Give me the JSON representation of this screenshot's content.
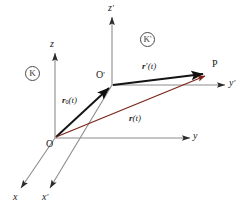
{
  "figure": {
    "background_color": "#ffffff",
    "width": 252,
    "height": 209
  },
  "colors": {
    "axis": "#808080",
    "axis_label": "#1a1a1a",
    "vector_black": "#1a1a1a",
    "vector_red": "#7a2418",
    "frame_circle": "#4d4d4d"
  },
  "axes": [
    {
      "id": "z",
      "label": "z",
      "prime": "",
      "frame": "K",
      "direction": "up"
    },
    {
      "id": "y",
      "label": "y",
      "prime": "",
      "frame": "K",
      "direction": "right"
    },
    {
      "id": "x",
      "label": "x",
      "prime": "",
      "frame": "K",
      "direction": "down-left"
    },
    {
      "id": "zprime",
      "label": "z",
      "prime": "'",
      "frame": "K'",
      "direction": "up"
    },
    {
      "id": "yprime",
      "label": "y",
      "prime": "'",
      "frame": "K'",
      "direction": "right"
    },
    {
      "id": "xprime",
      "label": "x",
      "prime": "'",
      "frame": "K'",
      "direction": "down-left"
    }
  ],
  "frames": [
    {
      "id": "K",
      "label": "K",
      "prime": "",
      "circled": true
    },
    {
      "id": "Kprime",
      "label": "K",
      "prime": "'",
      "circled": true
    }
  ],
  "points": [
    {
      "id": "O",
      "label": "O",
      "prime": "",
      "description": "origin of frame K"
    },
    {
      "id": "Oprime",
      "label": "O",
      "prime": "'",
      "description": "origin of frame K-prime"
    },
    {
      "id": "P",
      "label": "P",
      "prime": "",
      "description": "point P"
    }
  ],
  "vectors": [
    {
      "id": "r0",
      "symbol": "r",
      "subscript": "0",
      "argument": "(t)",
      "color": "#1a1a1a",
      "from": "O",
      "to": "Oprime",
      "label_text": "r0(t)"
    },
    {
      "id": "rprime",
      "symbol": "r",
      "prime": "'",
      "subscript": "",
      "argument": "(t)",
      "color": "#1a1a1a",
      "from": "Oprime",
      "to": "P",
      "label_text": "r'(t)"
    },
    {
      "id": "r",
      "symbol": "r",
      "prime": "",
      "subscript": "",
      "argument": "(t)",
      "color": "#7a2418",
      "from": "O",
      "to": "P",
      "label_text": "r(t)"
    }
  ]
}
